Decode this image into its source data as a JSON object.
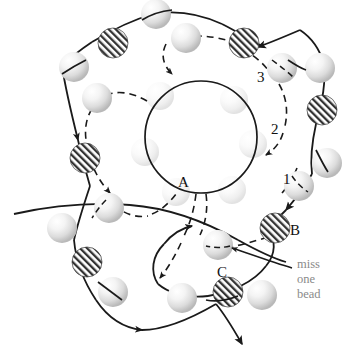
{
  "figure": {
    "background_color": "#ffffff",
    "stroke_color": "#1a1a1a",
    "note_color": "#8a8a8a",
    "bead_plain_color": "#e8e8e8",
    "bead_hatch_color": "#3a3a3a"
  },
  "labels": {
    "point_a": "A",
    "point_b": "B",
    "point_c": "C",
    "step_1": "1",
    "step_2": "2",
    "step_3": "3"
  },
  "annotation": {
    "line1": "miss",
    "line2": "one",
    "line3": "bead"
  },
  "elements": {
    "inner_circle": "inner-circle",
    "solid_path": "solid-thread-path",
    "dashed_path": "dashed-thread-path",
    "plain_beads": "plain-bead",
    "hatched_beads": "hatched-bead",
    "leader_line": "annotation-leader-line"
  }
}
